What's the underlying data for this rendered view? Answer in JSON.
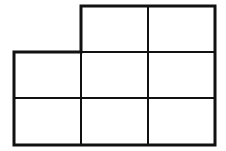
{
  "diagram": {
    "type": "grid-shape",
    "columns": 3,
    "rows": 3,
    "missing_cells": [
      [
        0,
        0
      ]
    ],
    "cell_count": 8,
    "stroke_color": "#111111",
    "background": "#ffffff",
    "x_lines": [
      14,
      81,
      148,
      215
    ],
    "y_lines": [
      6,
      52,
      98,
      145
    ],
    "outer_stroke_width": 3,
    "inner_stroke_width": 2
  }
}
